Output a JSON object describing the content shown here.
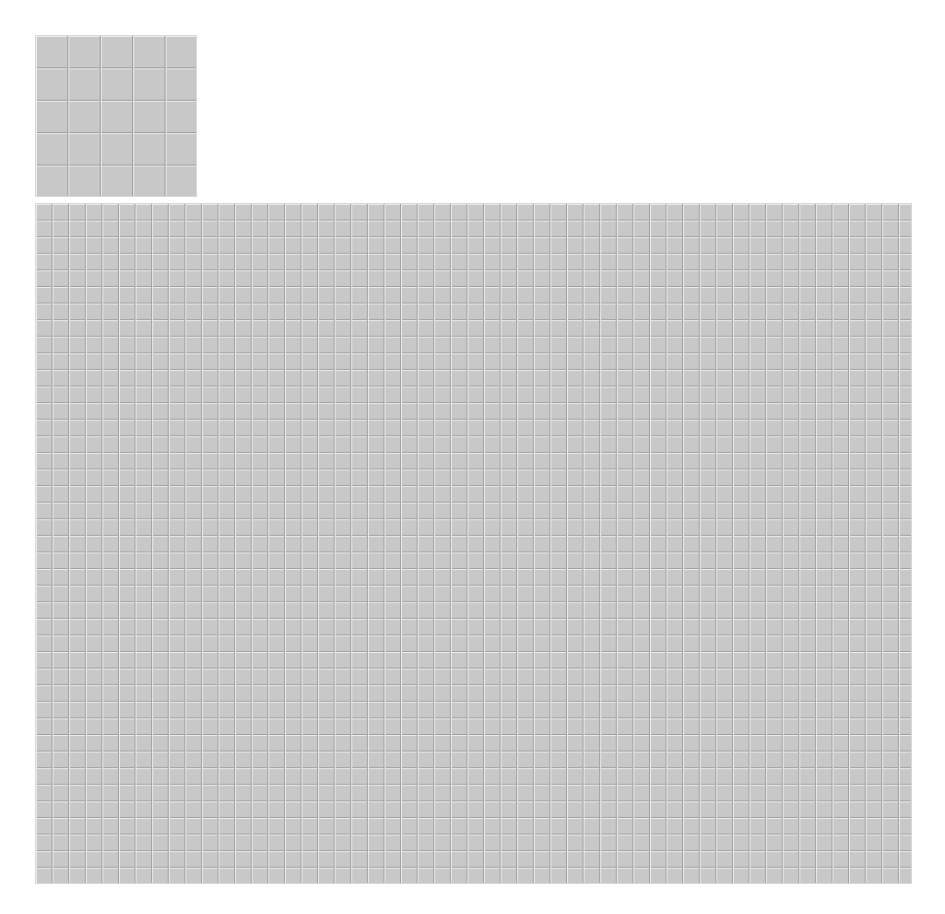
{
  "panels": {
    "small": {
      "description": "tiled grid texture, small view",
      "grid_cols": 5,
      "grid_rows": 5,
      "tile_color": "#c8c8c8",
      "grout_color": "#9a9a9a"
    },
    "large": {
      "description": "tiled grid texture, large view",
      "tile_color": "#c8c8c8",
      "grout_color": "#a0a0a0"
    }
  },
  "caption": {
    "text": ""
  }
}
